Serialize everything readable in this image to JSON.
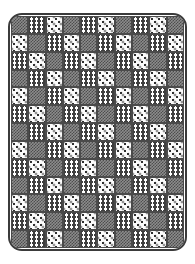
{
  "artwork": {
    "title": "Patchwork Quilt",
    "description": "A rectangular patchwork quilt with rounded corners, composed of a grid of alternating patterned fabric squares.",
    "background_color": "#ffffff"
  },
  "frame": {
    "name": "quilt-border",
    "border_color": "#3b3b3b",
    "border_width_px": 2,
    "corner_radius_px": 14,
    "x": 8,
    "y": 13,
    "width": 179,
    "height": 238
  },
  "grid": {
    "columns": 10,
    "rows": 13,
    "seam_color": "#4a4a4a",
    "seam_width_px": 1
  },
  "patterns": [
    {
      "id": "dark-check",
      "label": "Dark checkered fabric",
      "class": "pat-dark-check",
      "primary_color": "#4d4d4d",
      "secondary_color": "#8c8c8c"
    },
    {
      "id": "zigzag",
      "label": "Zigzag chevron fabric",
      "class": "pat-zigzag",
      "primary_color": "#3f3f3f",
      "secondary_color": "#ffffff"
    },
    {
      "id": "triangle",
      "label": "White fabric with dark triangle motifs",
      "class": "pat-triangle",
      "primary_color": "#2f2f2f",
      "secondary_color": "#fbfbfb"
    }
  ],
  "cells": [
    [
      "dark-check",
      "zigzag",
      "triangle",
      "dark-check",
      "zigzag",
      "triangle",
      "dark-check",
      "zigzag",
      "triangle",
      "dark-check"
    ],
    [
      "triangle",
      "dark-check",
      "zigzag",
      "triangle",
      "dark-check",
      "zigzag",
      "triangle",
      "dark-check",
      "zigzag",
      "triangle"
    ],
    [
      "zigzag",
      "triangle",
      "dark-check",
      "zigzag",
      "triangle",
      "dark-check",
      "zigzag",
      "triangle",
      "dark-check",
      "zigzag"
    ],
    [
      "dark-check",
      "zigzag",
      "triangle",
      "dark-check",
      "zigzag",
      "triangle",
      "dark-check",
      "zigzag",
      "triangle",
      "dark-check"
    ],
    [
      "triangle",
      "dark-check",
      "zigzag",
      "triangle",
      "dark-check",
      "zigzag",
      "triangle",
      "dark-check",
      "zigzag",
      "triangle"
    ],
    [
      "zigzag",
      "triangle",
      "dark-check",
      "zigzag",
      "triangle",
      "dark-check",
      "zigzag",
      "triangle",
      "dark-check",
      "zigzag"
    ],
    [
      "dark-check",
      "zigzag",
      "triangle",
      "dark-check",
      "zigzag",
      "triangle",
      "dark-check",
      "zigzag",
      "triangle",
      "dark-check"
    ],
    [
      "triangle",
      "dark-check",
      "zigzag",
      "triangle",
      "dark-check",
      "zigzag",
      "triangle",
      "dark-check",
      "zigzag",
      "triangle"
    ],
    [
      "zigzag",
      "triangle",
      "dark-check",
      "zigzag",
      "triangle",
      "dark-check",
      "zigzag",
      "triangle",
      "dark-check",
      "zigzag"
    ],
    [
      "dark-check",
      "zigzag",
      "triangle",
      "dark-check",
      "zigzag",
      "triangle",
      "dark-check",
      "zigzag",
      "triangle",
      "dark-check"
    ],
    [
      "triangle",
      "dark-check",
      "zigzag",
      "triangle",
      "dark-check",
      "zigzag",
      "triangle",
      "dark-check",
      "zigzag",
      "triangle"
    ],
    [
      "zigzag",
      "triangle",
      "dark-check",
      "zigzag",
      "triangle",
      "dark-check",
      "zigzag",
      "triangle",
      "dark-check",
      "zigzag"
    ],
    [
      "dark-check",
      "zigzag",
      "triangle",
      "dark-check",
      "zigzag",
      "triangle",
      "dark-check",
      "zigzag",
      "triangle",
      "dark-check"
    ]
  ]
}
